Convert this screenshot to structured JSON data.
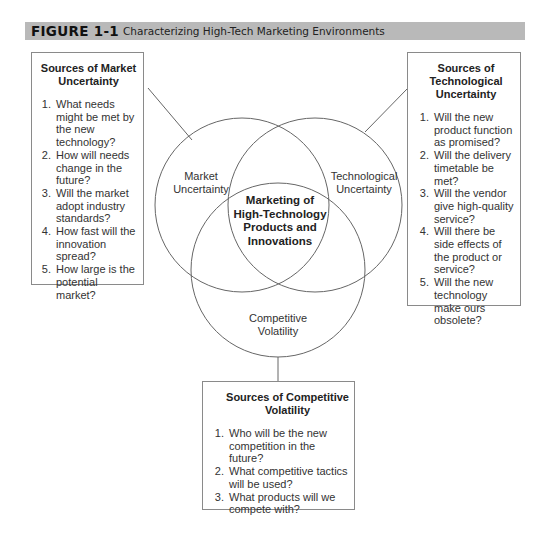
{
  "figure": {
    "number": "FIGURE 1-1",
    "title": "Characterizing High-Tech Marketing Environments",
    "header_color": "#b9b9b9"
  },
  "venn": {
    "circles": [
      {
        "id": "market",
        "label_lines": [
          "Market",
          "Uncertainty"
        ]
      },
      {
        "id": "technological",
        "label_lines": [
          "Technological",
          "Uncertainty"
        ]
      },
      {
        "id": "competitive",
        "label_lines": [
          "Competitive",
          "Volatility"
        ]
      }
    ],
    "center_label_lines": [
      "Marketing of",
      "High-Technology",
      "Products and",
      "Innovations"
    ]
  },
  "boxes": {
    "market": {
      "title_lines": [
        "Sources of Market",
        "Uncertainty"
      ],
      "items": [
        "What needs might be met by the new technology?",
        "How will needs change in the future?",
        "Will the market adopt industry standards?",
        "How fast will the innovation spread?",
        "How large is the potential market?"
      ]
    },
    "technological": {
      "title_lines": [
        "Sources of",
        "Technological",
        "Uncertainty"
      ],
      "items": [
        "Will the new product function as promised?",
        "Will the delivery timetable be met?",
        "Will the vendor give high-quality service?",
        "Will there be side effects of the product or service?",
        "Will the new technology make ours obsolete?"
      ]
    },
    "competitive": {
      "title_lines": [
        "Sources of Competitive",
        "Volatility"
      ],
      "items": [
        "Who will be the new competition in the future?",
        "What competitive tactics will be used?",
        "What products will we compete with?"
      ]
    }
  }
}
